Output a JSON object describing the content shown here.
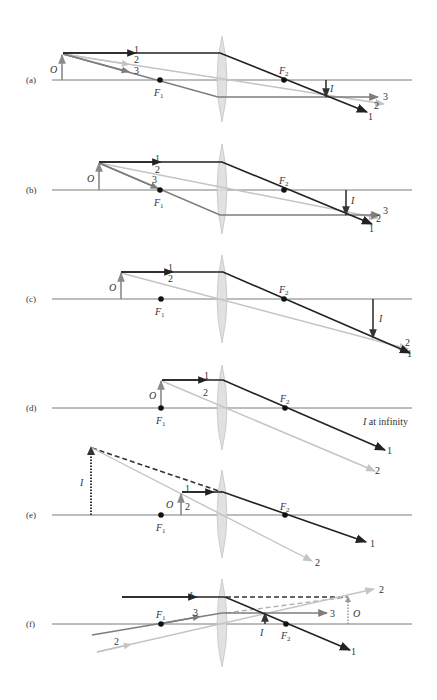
{
  "figure": {
    "colors": {
      "ray_1": "#222222",
      "ray_2": "#c4c4c4",
      "ray_3": "#7d7d7d",
      "axis": "#7a7a7a",
      "lens": "#dcdcdc"
    },
    "labels": {
      "object": "O",
      "image": "I",
      "focal_1": "F",
      "focal_1_sub": "1",
      "focal_2": "F",
      "focal_2_sub": "2",
      "ray_1": "1",
      "ray_2": "2",
      "ray_3": "3",
      "at_infinity": " at infinity"
    },
    "panels": [
      {
        "id": "a",
        "label": "(a)",
        "rays": [
          "1",
          "2",
          "3"
        ],
        "image_type": "real, inverted, reduced"
      },
      {
        "id": "b",
        "label": "(b)",
        "rays": [
          "1",
          "2",
          "3"
        ],
        "image_type": "real, inverted, same size"
      },
      {
        "id": "c",
        "label": "(c)",
        "rays": [
          "1",
          "2"
        ],
        "image_type": "real, inverted, enlarged"
      },
      {
        "id": "d",
        "label": "(d)",
        "rays": [
          "1",
          "2"
        ],
        "image_type": "I at infinity"
      },
      {
        "id": "e",
        "label": "(e)",
        "rays": [
          "1",
          "2"
        ],
        "image_type": "virtual, upright, enlarged"
      },
      {
        "id": "f",
        "label": "(f)",
        "rays": [
          "1",
          "2",
          "3"
        ],
        "image_type": "virtual object, real image"
      }
    ]
  }
}
